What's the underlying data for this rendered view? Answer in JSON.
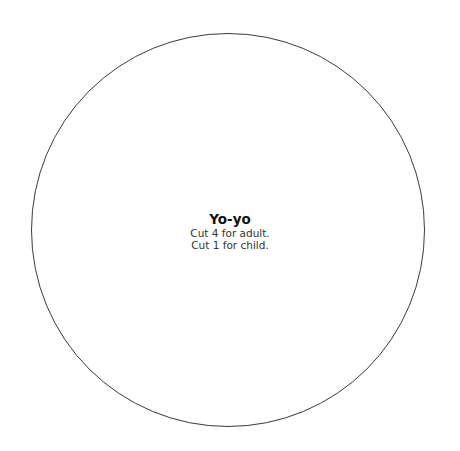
{
  "pattern": {
    "shape": "circle",
    "stroke_color": "#3a3a3a",
    "background_color": "#ffffff",
    "title": "Yo-yo",
    "instructions": [
      "Cut 4 for adult.",
      "Cut 1 for child."
    ]
  }
}
